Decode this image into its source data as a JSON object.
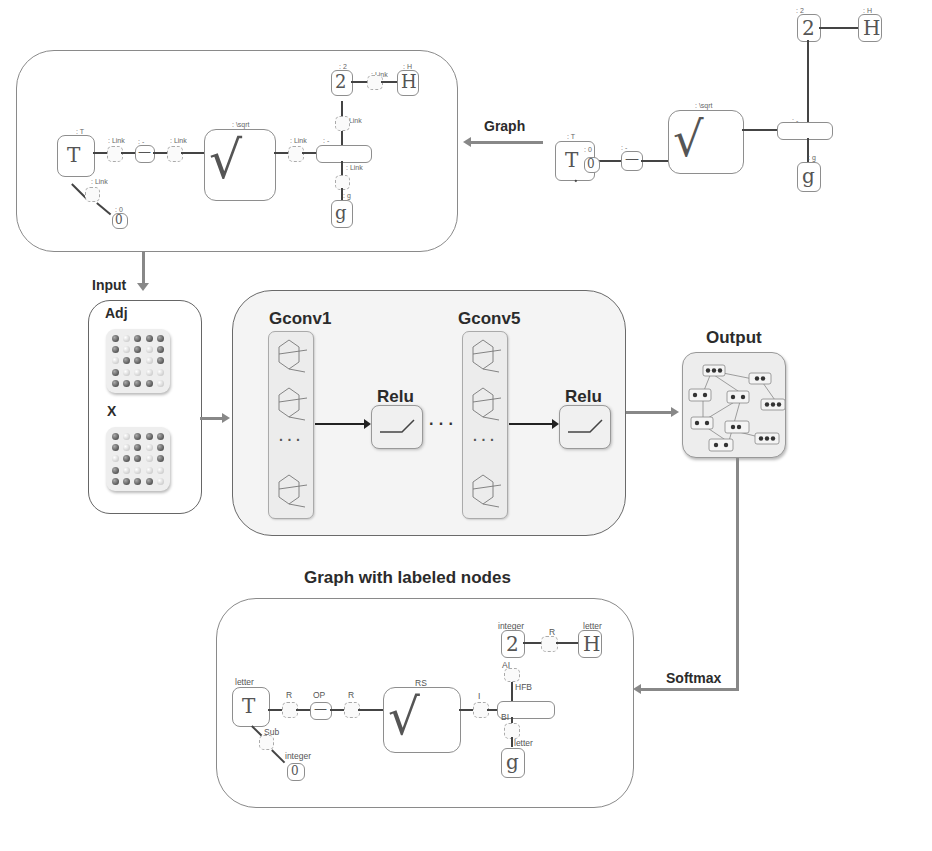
{
  "labels": {
    "graph_arrow": "Graph",
    "input": "Input",
    "adj": "Adj",
    "x": "X",
    "gconv_first": "Gconv1",
    "gconv_last": "Gconv5",
    "relu_1": "Relu",
    "relu_2": "Relu",
    "ellipsis_mid": "· · ·",
    "ellipsis_col": "· · ·",
    "output": "Output",
    "labeled_title": "Graph with labeled nodes",
    "softmax": "Softmax"
  },
  "raw_graph": {
    "nodes": {
      "T": "T",
      "minus": "—",
      "sqrt": "√",
      "frac": "—",
      "two": "2",
      "H": "H",
      "g": "g",
      "zero": "0"
    },
    "labels": {
      "T": ": T",
      "minus": ": -",
      "sqrt": ": \\sqrt",
      "frac": ": -",
      "two": ": 2",
      "H": ": H",
      "g": ": g",
      "zero": ": 0"
    }
  },
  "input_graph": {
    "nodes": {
      "T": "T",
      "minus": "—",
      "sqrt": "√",
      "frac": "—",
      "two": "2",
      "H": "H",
      "g": "g",
      "zero": "0"
    },
    "node_labels": {
      "T": ": T",
      "minus": ": -",
      "sqrt": ": \\sqrt",
      "frac": ": -",
      "two": ": 2",
      "H": ": H",
      "g": ": g",
      "zero": ": 0"
    },
    "edge_labels": {
      "T_minus": ": Link",
      "minus_sqrt": ": Link",
      "sqrt_frac": ": Link",
      "frac_two": ": Link",
      "two_H": ": Link",
      "frac_g": ": Link",
      "T_zero": ": Link"
    }
  },
  "labeled_graph": {
    "nodes": {
      "T": "T",
      "minus": "—",
      "sqrt": "√",
      "frac": "—",
      "two": "2",
      "H": "H",
      "g": "g",
      "zero": "0"
    },
    "node_labels": {
      "T": "letter",
      "minus": "OP",
      "sqrt": "RS",
      "frac": "HFB",
      "two": "integer",
      "H": "letter",
      "g": "letter",
      "zero": "integer"
    },
    "edge_labels": {
      "T_minus": "R",
      "minus_sqrt": "R",
      "sqrt_frac": "I",
      "frac_two": "AI",
      "two_H": "R",
      "frac_g": "BI",
      "T_zero": "Sub"
    }
  },
  "colors": {
    "arrow_gray": "#888888",
    "panel_border": "#6a6a6a",
    "panel_fill": "#f4f4f4",
    "text": "#2b2b2b"
  }
}
